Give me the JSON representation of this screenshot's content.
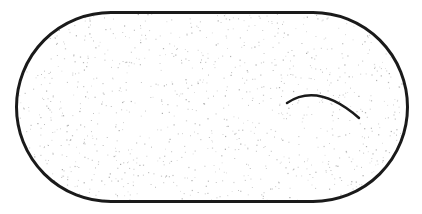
{
  "diagram": {
    "shape": "stadium",
    "stroke_color": "#1a1a1a",
    "fill_color": "#ffffff",
    "speckle_color": "#9a9a9a",
    "bounds": {
      "x": 16.5,
      "y": 12.5,
      "width": 391,
      "height": 189,
      "radius": 94.5
    },
    "curve": {
      "start": [
        287,
        103
      ],
      "control": [
        318,
        82
      ],
      "end": [
        359,
        118
      ]
    },
    "speckle_count": 1100
  }
}
